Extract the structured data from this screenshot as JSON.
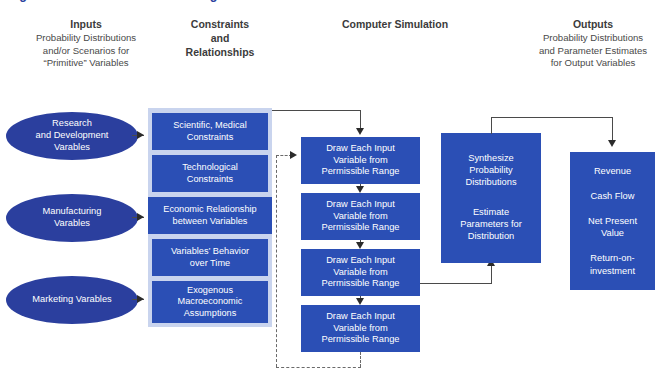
{
  "figure": {
    "title": "Figure 10-4. Pharma R&D Planning Model"
  },
  "headers": {
    "inputs": {
      "title": "Inputs",
      "subtitle": "Probability Distributions\nand/or Scenarios for\n“Primitive” Variables"
    },
    "constraints": {
      "line1": "Constraints",
      "line2": "and",
      "line3": "Relationships"
    },
    "simulation": {
      "title": "Computer Simulation"
    },
    "outputs": {
      "title": "Outputs",
      "subtitle": "Probability Distributions\nand Parameter Estimates\nfor Output Variables"
    }
  },
  "inputs": {
    "nodes": [
      {
        "label": "Research\nand Development\nVarables"
      },
      {
        "label": "Manufacturing\nVarables"
      },
      {
        "label": "Marketing Varables"
      }
    ]
  },
  "constraints": {
    "boxes": [
      {
        "label": "Scientific, Medical\nConstraints"
      },
      {
        "label": "Technological\nConstraints"
      },
      {
        "label": "Economic Relationship\nbetween Variables"
      },
      {
        "label": "Variables’ Behavior\nover Time"
      },
      {
        "label": "Exogenous\nMacroeconomic\nAssumptions"
      }
    ]
  },
  "simulation": {
    "boxes": [
      {
        "label": "Draw Each Input\nVariable from\nPermissible Range"
      },
      {
        "label": "Draw Each Input\nVariable from\nPermissible Range"
      },
      {
        "label": "Draw Each Input\nVariable from\nPermissible Range"
      },
      {
        "label": "Draw Each Input\nVariable from\nPermissible Range"
      }
    ]
  },
  "synthesis": {
    "line1": "Synthesize\nProbability\nDistributions",
    "line2": "Estimate\nParameters for\nDistribution"
  },
  "outputs": {
    "items": "Revenue\n\nCash Flow\n\nNet Present\nValue\n\nReturn-on-\ninvestment"
  },
  "colors": {
    "box_blue": "#2b4fb5",
    "ellipse_blue": "#2b3f9e",
    "panel_lavender": "#c9d4ee",
    "title_blue": "#2b3f9e",
    "connector_gray": "#4a4a4a",
    "text_gray": "#3a3a3a"
  }
}
